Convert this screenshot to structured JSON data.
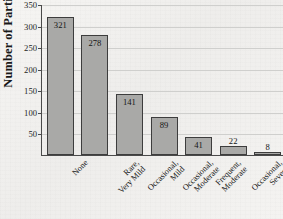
{
  "chart_data": {
    "type": "bar",
    "title": "",
    "xlabel": "",
    "ylabel": "Number of Participants",
    "ylim": [
      0,
      350
    ],
    "ytick_step": 50,
    "yticks": [
      50,
      100,
      150,
      200,
      250,
      300,
      350
    ],
    "grid": true,
    "legend": "none",
    "categories": [
      "None",
      "Rare, Very Mild",
      "Occasional, Mild",
      "Occasional, Moderate",
      "Frequent, Moderate",
      "Occasional, Severe",
      "Frequent, Severe"
    ],
    "category_lines": [
      [
        "None",
        ""
      ],
      [
        "Rare,",
        "Very Mild"
      ],
      [
        "Occasional,",
        "Mild"
      ],
      [
        "Occasional,",
        "Moderate"
      ],
      [
        "Frequent,",
        "Moderate"
      ],
      [
        "Occasional,",
        "Severe"
      ],
      [
        "Frequent,",
        "Severe"
      ]
    ],
    "values": [
      321,
      278,
      141,
      89,
      41,
      22,
      8
    ],
    "value_labels": [
      "321",
      "278",
      "141",
      "89",
      "41",
      "22",
      "8"
    ],
    "label_placement": [
      "inside",
      "inside",
      "inside",
      "inside",
      "inside",
      "above",
      "above"
    ],
    "colors": {
      "bar_fill": "#a9a9a7",
      "bar_border": "#3d3d3d",
      "gridline": "#cfcfcd",
      "axis": "#4a4a4a",
      "background": "#f3f2f0",
      "text": "#151515"
    }
  }
}
